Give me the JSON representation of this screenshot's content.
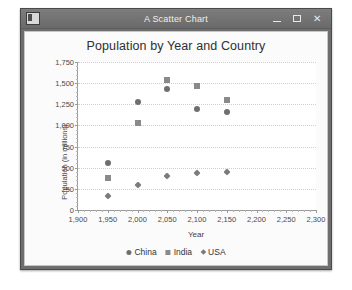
{
  "window": {
    "title": "A Scatter Chart",
    "app_icon": "window-app-icon",
    "minimize_label": "Minimize",
    "maximize_label": "Maximize",
    "close_label": "Close"
  },
  "chart_data": {
    "type": "scatter",
    "title": "Population by Year and Country",
    "xlabel": "Year",
    "ylabel": "Population (in millions)",
    "xlim": [
      1900,
      2300
    ],
    "ylim": [
      0,
      1750
    ],
    "xticks": [
      "1,900",
      "1,950",
      "2,000",
      "2,050",
      "2,100",
      "2,150",
      "2,200",
      "2,250",
      "2,300"
    ],
    "xtick_values": [
      1900,
      1950,
      2000,
      2050,
      2100,
      2150,
      2200,
      2250,
      2300
    ],
    "yticks": [
      "0",
      "250",
      "500",
      "750",
      "1,000",
      "1,250",
      "1,500",
      "1,750"
    ],
    "ytick_values": [
      0,
      250,
      500,
      750,
      1000,
      1250,
      1500,
      1750
    ],
    "grid": true,
    "legend_position": "bottom",
    "series": [
      {
        "name": "China",
        "marker": "circle",
        "color": "#6f6f6f",
        "x": [
          1950,
          2000,
          2050,
          2100,
          2150
        ],
        "y": [
          555,
          1275,
          1430,
          1200,
          1160
        ]
      },
      {
        "name": "India",
        "marker": "square",
        "color": "#8a8a8a",
        "x": [
          1950,
          2000,
          2050,
          2100,
          2150
        ],
        "y": [
          375,
          1025,
          1540,
          1470,
          1300
        ]
      },
      {
        "name": "USA",
        "marker": "diamond",
        "color": "#7b7b7b",
        "x": [
          1950,
          2000,
          2050,
          2100,
          2150
        ],
        "y": [
          160,
          290,
          400,
          440,
          450
        ]
      }
    ]
  }
}
